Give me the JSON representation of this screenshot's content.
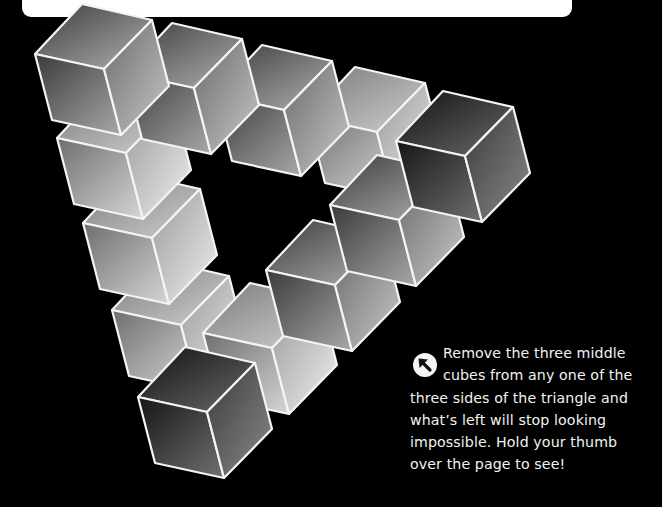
{
  "page": {
    "background": "#000000",
    "card_color": "#ffffff"
  },
  "illustration": {
    "subject": "impossible triangle made of cubes",
    "cube_count": 12,
    "outline_color": "#f4f4f4",
    "geometry": {
      "right": [
        70,
        16
      ],
      "left": [
        -47,
        50
      ],
      "center": [
        22,
        65
      ],
      "depth": [
        17,
        66
      ]
    },
    "cubes": [
      {
        "id": "c8",
        "side": "left",
        "top": [
          159,
          260
        ],
        "tone": "light"
      },
      {
        "id": "c7",
        "side": "left",
        "top": [
          130,
          173
        ],
        "tone": "light"
      },
      {
        "id": "c6",
        "side": "left",
        "top": [
          104,
          88
        ],
        "tone": "light"
      },
      {
        "id": "c10",
        "side": "right",
        "top": [
          250,
          283
        ],
        "tone": "light"
      },
      {
        "id": "c9",
        "side": "corner",
        "top": [
          185,
          347
        ],
        "tone": "dark"
      },
      {
        "id": "c11",
        "side": "right",
        "top": [
          313,
          220
        ],
        "tone": "mid"
      },
      {
        "id": "c4",
        "side": "top",
        "top": [
          355,
          67
        ],
        "tone": "light"
      },
      {
        "id": "c12",
        "side": "right",
        "top": [
          377,
          155
        ],
        "tone": "mid"
      },
      {
        "id": "c5",
        "side": "corner",
        "top": [
          443,
          91
        ],
        "tone": "dark"
      },
      {
        "id": "c3",
        "side": "top",
        "top": [
          262,
          45
        ],
        "tone": "mid"
      },
      {
        "id": "c2",
        "side": "top",
        "top": [
          172,
          23
        ],
        "tone": "mid"
      },
      {
        "id": "c1",
        "side": "corner",
        "top": [
          82,
          4
        ],
        "tone": "mid"
      }
    ]
  },
  "caption": {
    "icon": "arrow-up-left-icon",
    "lines": [
      "Remove the three middle",
      "cubes from any one of the",
      "three sides of the triangle and",
      "what’s left will stop looking",
      "impossible. Hold your thumb",
      "over the page to see!"
    ]
  }
}
